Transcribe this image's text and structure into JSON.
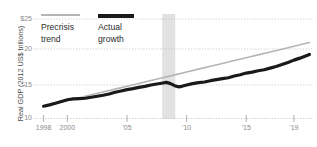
{
  "chart_data": {
    "type": "line",
    "title": "",
    "subtitle": "",
    "xlabel": "",
    "ylabel": "Real GDP (2012 US$ trillions)",
    "xlim": [
      1997.2,
      2020.6
    ],
    "ylim": [
      10,
      25
    ],
    "grid": true,
    "grid_style": "dotted-horizontal",
    "legend_position": "top-left-inside",
    "y_ticks": [
      {
        "value": 25,
        "label": "$25"
      },
      {
        "value": 20,
        "label": "20"
      },
      {
        "value": 15,
        "label": "15"
      },
      {
        "value": 10,
        "label": "10"
      }
    ],
    "x_ticks": [
      {
        "value": 1998,
        "label": "1998"
      },
      {
        "value": 2000,
        "label": "2000"
      },
      {
        "value": 2005,
        "label": "'05"
      },
      {
        "value": 2010,
        "label": "'10"
      },
      {
        "value": 2015,
        "label": "'15"
      },
      {
        "value": 2019,
        "label": "'19"
      }
    ],
    "annotations": [
      {
        "name": "recession-band",
        "type": "vertical-span",
        "x_start": 2007.95,
        "x_end": 2009.05,
        "color": "#e2e2e2"
      }
    ],
    "series": [
      {
        "name": "Precrisis trend",
        "color": "#b5b5b5",
        "width": 1.6,
        "x": [
          1998,
          1999,
          2000,
          2001,
          2002,
          2003,
          2004,
          2005,
          2006,
          2007,
          2008,
          2009,
          2010,
          2011,
          2012,
          2013,
          2014,
          2015,
          2016,
          2017,
          2018,
          2019,
          2020.3
        ],
        "values": [
          11.85,
          12.28,
          12.71,
          13.14,
          13.57,
          14.0,
          14.43,
          14.86,
          15.29,
          15.72,
          16.15,
          16.58,
          17.01,
          17.44,
          17.87,
          18.3,
          18.73,
          19.16,
          19.59,
          20.02,
          20.45,
          20.88,
          21.45
        ]
      },
      {
        "name": "Actual growth",
        "color": "#1a1a1a",
        "width": 3.2,
        "x": [
          1998,
          1998.5,
          1999,
          1999.5,
          2000,
          2000.5,
          2001,
          2001.5,
          2002,
          2002.5,
          2003,
          2003.5,
          2004,
          2004.5,
          2005,
          2005.5,
          2006,
          2006.5,
          2007,
          2007.5,
          2008,
          2008.3,
          2008.6,
          2009,
          2009.3,
          2009.6,
          2010,
          2010.5,
          2011,
          2011.5,
          2012,
          2012.5,
          2013,
          2013.5,
          2014,
          2014.5,
          2015,
          2015.5,
          2016,
          2016.5,
          2017,
          2017.5,
          2018,
          2018.5,
          2019,
          2019.5,
          2020.3
        ],
        "values": [
          11.85,
          12.05,
          12.3,
          12.55,
          12.82,
          12.95,
          13.0,
          13.05,
          13.2,
          13.35,
          13.5,
          13.7,
          13.95,
          14.15,
          14.35,
          14.5,
          14.7,
          14.85,
          15.05,
          15.2,
          15.35,
          15.45,
          15.3,
          14.95,
          14.78,
          14.85,
          15.05,
          15.25,
          15.4,
          15.5,
          15.7,
          15.85,
          16.0,
          16.15,
          16.4,
          16.6,
          16.85,
          17.0,
          17.2,
          17.35,
          17.6,
          17.85,
          18.15,
          18.45,
          18.8,
          19.1,
          19.65
        ]
      }
    ]
  },
  "legend": {
    "entries": [
      {
        "label_line1": "Precrisis",
        "label_line2": "trend",
        "icon": "line-swatch-gray"
      },
      {
        "label_line1": "Actual",
        "label_line2": "growth",
        "icon": "line-swatch-black"
      }
    ]
  },
  "colors": {
    "trend": "#b5b5b5",
    "actual": "#1a1a1a",
    "recession_band": "#e2e2e2",
    "grid": "#b9b9b9",
    "tick_text": "#8a8a8a",
    "axis_title": "#4d4d4d"
  }
}
